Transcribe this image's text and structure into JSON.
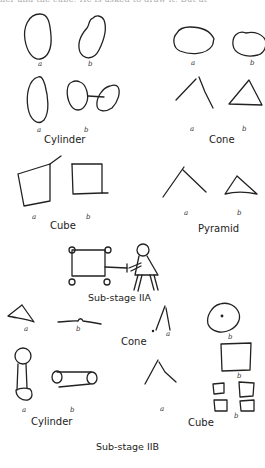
{
  "page": {
    "top_text": "ner and the cube. He is asked to draw it. But at"
  },
  "stage_1": {
    "cylinder": {
      "caption": "Cylinder",
      "label_a1": "a",
      "label_b1": "b",
      "label_a2": "a",
      "label_b2": "b"
    },
    "cone": {
      "caption": "Cone",
      "label_a1": "a",
      "label_b1": "b",
      "label_a2": "a",
      "label_b2": "b"
    },
    "cube": {
      "caption": "Cube",
      "label_a": "a",
      "label_b": "b"
    },
    "pyramid": {
      "caption": "Pyramid",
      "label_a": "a",
      "label_b": "b"
    },
    "title": "Sub-stage IIA"
  },
  "stage_2": {
    "pyramid_row": {
      "label_a": "a",
      "label_b": "b"
    },
    "cone": {
      "caption": "Cone",
      "label_a": "a",
      "label_b": "b"
    },
    "cylinder": {
      "caption": "Cylinder",
      "label_a": "a",
      "label_b": "b"
    },
    "cube": {
      "caption": "Cube",
      "label_a": "a",
      "label_b1": "b",
      "label_b2": "b"
    },
    "title": "Sub-stage IIB"
  }
}
